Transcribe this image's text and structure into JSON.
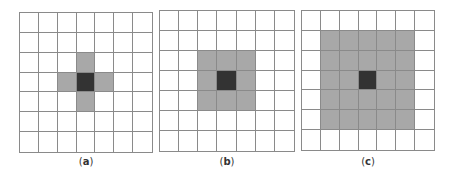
{
  "figure": {
    "grid_size": 7,
    "colors": {
      "line": "#8a8a8a",
      "empty": "#ffffff",
      "neighbor": "#a8a8a8",
      "center": "#333333"
    },
    "panels": [
      {
        "id": "a",
        "label_open": "(",
        "label_letter": "a",
        "label_close": ")",
        "neighborhood": "4-connected cross (radius 1)",
        "left": 19,
        "top": 12,
        "width": 134,
        "height": 141,
        "gray_cells": [
          [
            2,
            3
          ],
          [
            3,
            2
          ],
          [
            3,
            4
          ],
          [
            4,
            3
          ]
        ],
        "center_cell": [
          3,
          3
        ]
      },
      {
        "id": "b",
        "label_open": "(",
        "label_letter": "b",
        "label_close": ")",
        "neighborhood": "8-connected 3x3 square",
        "left": 159,
        "top": 10,
        "width": 136,
        "height": 142,
        "gray_cells": [
          [
            2,
            2
          ],
          [
            2,
            3
          ],
          [
            2,
            4
          ],
          [
            3,
            2
          ],
          [
            3,
            4
          ],
          [
            4,
            2
          ],
          [
            4,
            3
          ],
          [
            4,
            4
          ]
        ],
        "center_cell": [
          3,
          3
        ]
      },
      {
        "id": "c",
        "label_open": "(",
        "label_letter": "c",
        "label_close": ")",
        "neighborhood": "5x5 square",
        "left": 301,
        "top": 10,
        "width": 134,
        "height": 141,
        "gray_rows": [
          1,
          5
        ],
        "gray_cols": [
          1,
          5
        ],
        "center_cell": [
          3,
          3
        ]
      }
    ]
  }
}
